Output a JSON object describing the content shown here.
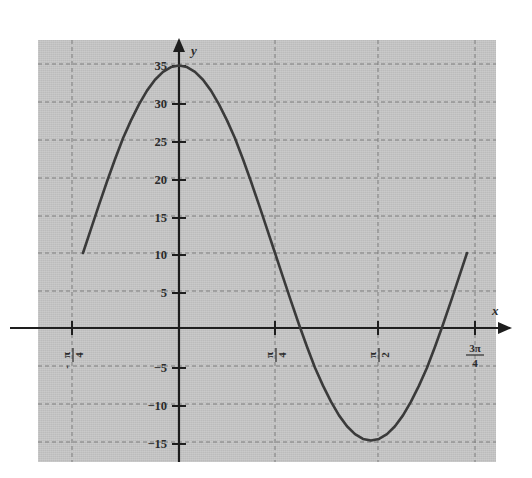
{
  "figure": {
    "background_color": "#ffffff",
    "plot_background_color": "#c2c2c2",
    "curve_color": "#3a3a3a",
    "axis_color": "#1e1e1e",
    "grid_color": "#7d7d7d"
  },
  "axes": {
    "x_axis_label": "x",
    "y_axis_label": "y"
  },
  "chart_data": {
    "type": "line",
    "title": "",
    "xlabel": "x",
    "ylabel": "y",
    "grid": true,
    "grid_style": "dashed",
    "legend": null,
    "function": "y = 10 + 25·cos(2x)",
    "amplitude": 25,
    "vertical_shift": 10,
    "period": "π",
    "maximum": 35,
    "minimum": -15,
    "xlim": [
      -1.0472,
      2.618
    ],
    "ylim": [
      -18.5,
      37.5
    ],
    "x_ticks": [
      -0.7854,
      0.7854,
      1.5708,
      2.3562
    ],
    "x_tick_labels": [
      {
        "sign": "-",
        "numerator": "π",
        "denominator": "4"
      },
      {
        "sign": "",
        "numerator": "π",
        "denominator": "4"
      },
      {
        "sign": "",
        "numerator": "π",
        "denominator": "2"
      },
      {
        "sign": "",
        "numerator": "3π",
        "denominator": "4"
      }
    ],
    "y_ticks": [
      -15,
      -10,
      -5,
      5,
      10,
      15,
      20,
      25,
      30,
      35
    ],
    "y_tick_labels": [
      "−15",
      "−10",
      "−5",
      "5",
      "10",
      "15",
      "20",
      "25",
      "30",
      "35"
    ],
    "key_points": [
      {
        "x": -0.7854,
        "y": 10,
        "note": "left endpoint at -π/4"
      },
      {
        "x": 0,
        "y": 35,
        "note": "maximum"
      },
      {
        "x": 0.7854,
        "y": 10,
        "note": "π/4"
      },
      {
        "x": 1.5708,
        "y": -15,
        "note": "minimum at π/2"
      },
      {
        "x": 2.3562,
        "y": 10,
        "note": "right endpoint at 3π/4"
      }
    ],
    "x": [
      -0.7854,
      -0.7199,
      -0.6545,
      -0.589,
      -0.5236,
      -0.4581,
      -0.3927,
      -0.3272,
      -0.2618,
      -0.1963,
      -0.1309,
      -0.0654,
      0.0,
      0.0654,
      0.1309,
      0.1963,
      0.2618,
      0.3272,
      0.3927,
      0.4581,
      0.5236,
      0.589,
      0.6545,
      0.7199,
      0.7854,
      0.8508,
      0.9163,
      0.9817,
      1.0472,
      1.1126,
      1.1781,
      1.2435,
      1.309,
      1.3744,
      1.4399,
      1.5053,
      1.5708,
      1.6362,
      1.7017,
      1.7671,
      1.8326,
      1.898,
      1.9635,
      2.0289,
      2.0944,
      2.1598,
      2.2253,
      2.2907,
      2.3562
    ],
    "y": [
      10.0,
      13.22,
      16.41,
      19.53,
      22.5,
      25.31,
      27.68,
      29.82,
      31.65,
      33.1,
      34.15,
      34.79,
      35.0,
      34.79,
      34.15,
      33.1,
      31.65,
      29.82,
      27.68,
      25.31,
      22.5,
      19.53,
      16.41,
      13.22,
      10.0,
      6.78,
      3.59,
      0.47,
      -2.5,
      -5.31,
      -7.68,
      -9.82,
      -11.65,
      -13.1,
      -14.15,
      -14.79,
      -15.0,
      -14.79,
      -14.15,
      -13.1,
      -11.65,
      -9.82,
      -7.68,
      -5.31,
      -2.5,
      0.47,
      3.59,
      6.78,
      10.0
    ]
  }
}
